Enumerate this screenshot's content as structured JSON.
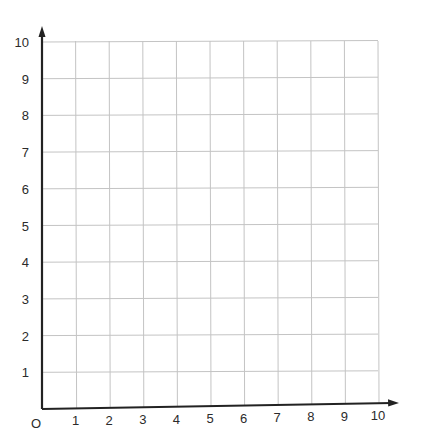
{
  "chart_data": {
    "type": "scatter",
    "title": "",
    "xlabel": "",
    "ylabel": "",
    "x": [],
    "y": [],
    "series": [],
    "xlim": [
      0,
      10
    ],
    "ylim": [
      0,
      10
    ],
    "x_ticks": [
      "1",
      "2",
      "3",
      "4",
      "5",
      "6",
      "7",
      "8",
      "9",
      "10"
    ],
    "y_ticks": [
      "1",
      "2",
      "3",
      "4",
      "5",
      "6",
      "7",
      "8",
      "9",
      "10"
    ],
    "origin_label": "O",
    "grid": true,
    "legend": null,
    "note": "Blank coordinate grid, first quadrant, 0-10 on both axes, axes with arrowheads"
  },
  "colors": {
    "grid": "#c4c4c4",
    "axis": "#222222",
    "label": "#2b2b2b",
    "background": "#ffffff"
  }
}
